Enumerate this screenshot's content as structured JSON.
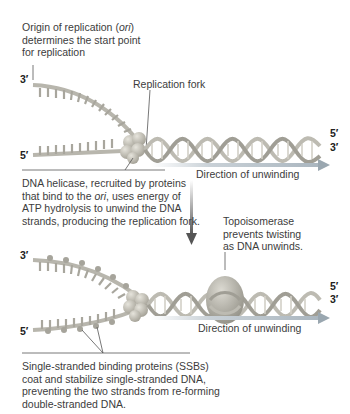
{
  "diagram": {
    "panel_top": {
      "origin_label": {
        "line1_pre": "Origin of replication (",
        "line1_ital": "ori",
        "line1_post": ")",
        "line2": "determines the start point",
        "line3": "for replication"
      },
      "fork_label": "Replication fork",
      "strand_ends": {
        "top_left": "3′",
        "bottom_left": "5′",
        "right_top": "5′",
        "right_bottom": "3′"
      },
      "direction_label": "Direction of unwinding",
      "helicase_caption": {
        "line1": "DNA helicase, recruited by proteins",
        "line2_pre": "that bind to the ",
        "line2_ital": "ori",
        "line2_post": ", uses energy of",
        "line3": "ATP hydrolysis to unwind the DNA",
        "line4": "strands, producing the replication fork."
      }
    },
    "panel_bottom": {
      "topoisomerase_label": {
        "line1": "Topoisomerase",
        "line2": "prevents twisting",
        "line3": "as DNA unwinds."
      },
      "strand_ends": {
        "top_left": "3′",
        "bottom_left": "5′",
        "right_top": "5′",
        "right_bottom": "3′"
      },
      "direction_label": "Direction of unwinding",
      "ssb_caption": {
        "line1": "Single-stranded binding proteins (SSBs)",
        "line2": "coat and stabilize single-stranded DNA,",
        "line3": "preventing the two strands from re-forming",
        "line4": "double-stranded DNA."
      }
    },
    "colors": {
      "strand": "#b8b6ad",
      "strand_dark": "#8d8b82",
      "helix_base": "#c9c7bd",
      "protein": "#b5b2a6",
      "topoisomerase": "#a8a69b",
      "arrow": "#b8c3cb",
      "arrow_head": "#9aa7b0",
      "down_arrow": "#6d6d6d"
    }
  }
}
